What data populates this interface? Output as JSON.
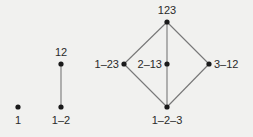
{
  "diagram": {
    "colors": {
      "node": "#1a1a1a",
      "edge": "#777777",
      "text": "#2a2a2a",
      "background": "#f1f1ef"
    },
    "lattices": [
      {
        "id": "n1",
        "nodes": [
          {
            "id": "1",
            "label": "1",
            "x": 18,
            "y": 107,
            "label_pos": "below"
          }
        ],
        "edges": []
      },
      {
        "id": "n2",
        "nodes": [
          {
            "id": "12",
            "label": "12",
            "x": 61,
            "y": 64,
            "label_pos": "above"
          },
          {
            "id": "1-2",
            "label": "1–2",
            "x": 61,
            "y": 107,
            "label_pos": "below"
          }
        ],
        "edges": [
          [
            "12",
            "1-2"
          ]
        ]
      },
      {
        "id": "n3",
        "nodes": [
          {
            "id": "123",
            "label": "123",
            "x": 167,
            "y": 22,
            "label_pos": "above"
          },
          {
            "id": "1-23",
            "label": "1–23",
            "x": 124,
            "y": 64,
            "label_pos": "left"
          },
          {
            "id": "2-13",
            "label": "2–13",
            "x": 167,
            "y": 64,
            "label_pos": "left"
          },
          {
            "id": "3-12",
            "label": "3–12",
            "x": 209,
            "y": 64,
            "label_pos": "right"
          },
          {
            "id": "1-2-3",
            "label": "1–2–3",
            "x": 167,
            "y": 107,
            "label_pos": "below"
          }
        ],
        "edges": [
          [
            "123",
            "1-23"
          ],
          [
            "123",
            "2-13"
          ],
          [
            "123",
            "3-12"
          ],
          [
            "1-23",
            "1-2-3"
          ],
          [
            "2-13",
            "1-2-3"
          ],
          [
            "3-12",
            "1-2-3"
          ]
        ]
      }
    ]
  }
}
